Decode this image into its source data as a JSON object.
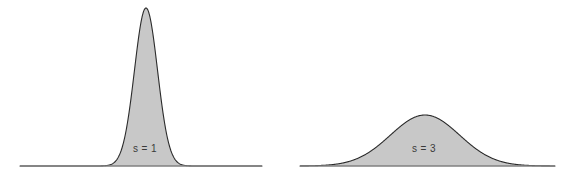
{
  "figure": {
    "width": 576,
    "height": 181,
    "background": "#ffffff"
  },
  "style": {
    "fill_color": "#c8c8c8",
    "outline_color": "#2b2b2b",
    "baseline_color": "#808080",
    "label_color": "#3a3a3a",
    "label_font_size_px": 10
  },
  "chart_data": [
    {
      "type": "area",
      "name": "narrow-gaussian",
      "title": "",
      "xlabel": "",
      "ylabel": "",
      "annotation": "s = 1",
      "scale_parameter": 1,
      "mean": 0,
      "curve": "gaussian",
      "grid": false,
      "legend": "none",
      "axis_visible": true,
      "xlim": [
        -6,
        6
      ],
      "ylim": [
        0,
        0.41
      ],
      "peak_value": 0.399,
      "peak_x": 0,
      "geometry": {
        "baseline_y": 166,
        "baseline_x_start": 20,
        "baseline_x_end": 262,
        "curve_center_x": 146,
        "peak_y": 8,
        "peak_height": 158,
        "x_units_per_px": 0.0868,
        "label_x": 145,
        "label_y": 149
      },
      "x": [
        -6,
        -5,
        -4,
        -3,
        -2.5,
        -2,
        -1.5,
        -1,
        -0.5,
        0,
        0.5,
        1,
        1.5,
        2,
        2.5,
        3,
        4,
        5,
        6
      ],
      "values": [
        0.0,
        0.0,
        0.0,
        0.004,
        0.018,
        0.054,
        0.13,
        0.242,
        0.352,
        0.399,
        0.352,
        0.242,
        0.13,
        0.054,
        0.018,
        0.004,
        0.0,
        0.0,
        0.0
      ]
    },
    {
      "type": "area",
      "name": "wide-gaussian",
      "title": "",
      "xlabel": "",
      "ylabel": "",
      "annotation": "s = 3",
      "scale_parameter": 3,
      "mean": 0,
      "curve": "gaussian",
      "grid": false,
      "legend": "none",
      "axis_visible": true,
      "xlim": [
        -6,
        6
      ],
      "ylim": [
        0,
        0.41
      ],
      "peak_value": 0.133,
      "peak_x": 0,
      "geometry": {
        "baseline_y": 166,
        "baseline_x_start": 300,
        "baseline_x_end": 555,
        "curve_center_x": 425,
        "peak_y": 115,
        "peak_height": 51,
        "x_units_per_px": 0.0868,
        "label_x": 424,
        "label_y": 149
      },
      "x": [
        -6,
        -5,
        -4,
        -3,
        -2.5,
        -2,
        -1.5,
        -1,
        -0.5,
        0,
        0.5,
        1,
        1.5,
        2,
        2.5,
        3,
        4,
        5,
        6
      ],
      "values": [
        0.018,
        0.033,
        0.055,
        0.081,
        0.094,
        0.106,
        0.117,
        0.126,
        0.131,
        0.133,
        0.131,
        0.126,
        0.117,
        0.106,
        0.094,
        0.081,
        0.055,
        0.033,
        0.018
      ]
    }
  ]
}
